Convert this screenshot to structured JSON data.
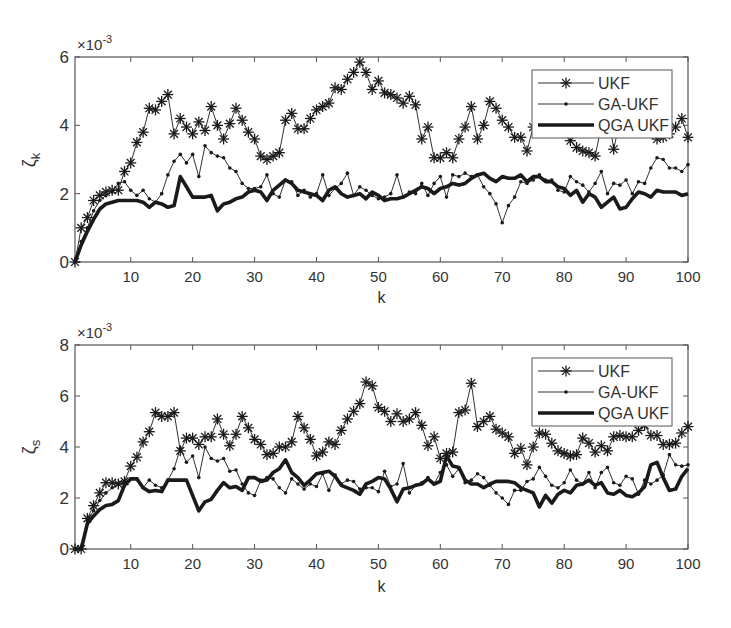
{
  "figure": {
    "top_cutoff_text": "",
    "colors": {
      "line": "#1a1a1a",
      "axis": "#555555",
      "background": "#ffffff"
    }
  },
  "chart_data": [
    {
      "type": "line",
      "title": "",
      "xlabel": "k",
      "ylabel": "ζ_k",
      "ylabel_main": "ζ",
      "ylabel_sub": "k",
      "exponent_label": "×10",
      "exponent_power": "-3",
      "xlim": [
        1,
        100
      ],
      "ylim": [
        0,
        6
      ],
      "xticks": [
        10,
        20,
        30,
        40,
        50,
        60,
        70,
        80,
        90,
        100
      ],
      "yticks": [
        0,
        2,
        4,
        6
      ],
      "grid": false,
      "legend_position": "upper right",
      "legend": [
        "UKF",
        "GA-UKF",
        "QGA UKF"
      ],
      "series": [
        {
          "name": "UKF",
          "marker": "asterisk",
          "linewidth": 1,
          "values": [
            0,
            1.0,
            1.3,
            1.8,
            1.95,
            2.05,
            2.1,
            2.1,
            2.65,
            2.9,
            3.5,
            3.8,
            4.5,
            4.45,
            4.7,
            4.9,
            3.75,
            4.2,
            3.95,
            3.75,
            4.1,
            3.85,
            4.55,
            4.0,
            3.6,
            4.05,
            4.5,
            4.15,
            3.8,
            3.6,
            3.1,
            3.0,
            3.1,
            3.2,
            4.15,
            4.35,
            3.9,
            3.9,
            4.2,
            4.45,
            4.55,
            4.65,
            5.1,
            5.05,
            5.35,
            5.55,
            5.85,
            5.55,
            5.05,
            5.3,
            4.95,
            4.9,
            4.8,
            4.65,
            4.85,
            4.6,
            3.6,
            3.95,
            3.05,
            3.05,
            3.2,
            3.05,
            3.6,
            3.95,
            4.55,
            3.6,
            4.0,
            4.7,
            4.5,
            4.15,
            3.95,
            3.65,
            3.65,
            3.25,
            3.95,
            4.4,
            4.55,
            4.5,
            4.05,
            3.8,
            3.55,
            3.35,
            3.25,
            3.2,
            3.1,
            3.95,
            4.5,
            3.3,
            4.15,
            4.2,
            4.15,
            3.95,
            4.4,
            4.55,
            3.6,
            3.65,
            3.75,
            3.95,
            4.2,
            3.65
          ]
        },
        {
          "name": "GA-UKF",
          "marker": "dot",
          "linewidth": 1,
          "values": [
            0,
            0.6,
            1.0,
            1.5,
            1.8,
            1.95,
            2.05,
            2.3,
            2.35,
            2.1,
            1.95,
            2.1,
            1.85,
            1.75,
            2.0,
            2.55,
            2.95,
            3.15,
            2.9,
            3.15,
            2.5,
            3.4,
            3.2,
            3.1,
            3.05,
            2.75,
            2.65,
            2.3,
            2.15,
            2.15,
            2.2,
            2.55,
            2.0,
            1.9,
            2.4,
            2.35,
            1.95,
            2.1,
            1.9,
            2.0,
            2.55,
            1.95,
            2.15,
            2.3,
            2.6,
            1.95,
            2.2,
            2.1,
            1.95,
            1.85,
            1.9,
            2.0,
            2.55,
            1.9,
            2.05,
            2.0,
            2.3,
            1.95,
            2.3,
            2.5,
            1.9,
            2.55,
            2.5,
            2.6,
            2.5,
            2.55,
            2.2,
            2.0,
            1.7,
            1.15,
            1.65,
            1.9,
            2.35,
            2.3,
            2.4,
            2.55,
            2.4,
            2.4,
            2.1,
            2.05,
            2.5,
            2.35,
            2.25,
            2.05,
            2.3,
            2.65,
            2.0,
            2.3,
            2.25,
            2.4,
            2.0,
            2.35,
            2.3,
            2.75,
            3.05,
            3.0,
            2.75,
            2.75,
            2.65,
            2.85
          ]
        },
        {
          "name": "QGA UKF",
          "marker": "none",
          "linewidth": 3,
          "values": [
            0,
            0.5,
            0.9,
            1.25,
            1.55,
            1.7,
            1.75,
            1.8,
            1.8,
            1.8,
            1.8,
            1.75,
            1.6,
            1.75,
            1.7,
            1.6,
            1.65,
            2.5,
            2.2,
            1.9,
            1.9,
            1.9,
            1.95,
            1.5,
            1.7,
            1.75,
            1.85,
            1.9,
            2.05,
            2.1,
            2.05,
            1.8,
            2.1,
            2.25,
            2.4,
            2.3,
            2.1,
            2.05,
            2.0,
            1.95,
            1.8,
            2.1,
            2.2,
            2.0,
            1.9,
            1.95,
            2.0,
            1.85,
            2.05,
            1.95,
            1.8,
            1.85,
            1.85,
            1.9,
            2.0,
            2.1,
            2.2,
            2.15,
            2.0,
            2.15,
            2.2,
            2.3,
            2.25,
            2.3,
            2.45,
            2.55,
            2.6,
            2.45,
            2.35,
            2.5,
            2.45,
            2.45,
            2.55,
            2.35,
            2.5,
            2.5,
            2.35,
            2.35,
            2.2,
            2.15,
            1.95,
            2.1,
            1.75,
            2.0,
            1.9,
            1.6,
            1.75,
            1.9,
            1.55,
            1.6,
            1.85,
            2.05,
            2.0,
            1.9,
            2.1,
            2.05,
            2.05,
            2.05,
            1.95,
            2.0
          ]
        }
      ]
    },
    {
      "type": "line",
      "title": "",
      "xlabel": "k",
      "ylabel": "ζ_s",
      "ylabel_main": "ζ",
      "ylabel_sub": "s",
      "exponent_label": "×10",
      "exponent_power": "-3",
      "xlim": [
        1,
        100
      ],
      "ylim": [
        0,
        8
      ],
      "xticks": [
        10,
        20,
        30,
        40,
        50,
        60,
        70,
        80,
        90,
        100
      ],
      "yticks": [
        0,
        2,
        4,
        6,
        8
      ],
      "grid": false,
      "legend_position": "upper right",
      "legend": [
        "UKF",
        "GA-UKF",
        "QGA UKF"
      ],
      "series": [
        {
          "name": "UKF",
          "marker": "asterisk",
          "linewidth": 1,
          "values": [
            0,
            0,
            1.2,
            1.7,
            2.2,
            2.6,
            2.6,
            2.55,
            2.65,
            3.25,
            3.6,
            4.2,
            4.6,
            5.35,
            5.2,
            5.2,
            5.35,
            3.85,
            4.35,
            4.35,
            4.1,
            4.4,
            4.4,
            5.1,
            4.5,
            4.05,
            4.5,
            5.2,
            4.75,
            4.3,
            4.1,
            3.7,
            3.75,
            4.0,
            4.0,
            4.2,
            5.2,
            4.75,
            4.3,
            3.65,
            3.8,
            4.2,
            4.1,
            4.65,
            5.1,
            5.4,
            5.7,
            6.55,
            6.4,
            5.55,
            5.4,
            5.0,
            5.3,
            5.0,
            5.1,
            5.35,
            4.85,
            4.05,
            4.4,
            3.55,
            3.75,
            3.8,
            5.35,
            5.45,
            6.5,
            4.8,
            5.0,
            5.2,
            4.7,
            4.55,
            4.4,
            3.75,
            3.95,
            3.3,
            4.0,
            4.55,
            4.5,
            4.15,
            3.85,
            3.75,
            3.65,
            3.7,
            4.35,
            4.15,
            3.8,
            4.05,
            3.85,
            4.4,
            4.45,
            4.4,
            4.4,
            4.65,
            4.85,
            4.45,
            4.45,
            4.1,
            4.1,
            4.15,
            4.55,
            4.8
          ]
        },
        {
          "name": "GA-UKF",
          "marker": "dot",
          "linewidth": 1,
          "values": [
            0,
            0,
            1.1,
            1.5,
            1.9,
            2.2,
            2.4,
            2.55,
            2.6,
            2.75,
            2.75,
            2.4,
            2.7,
            2.5,
            2.4,
            2.7,
            3.15,
            3.95,
            3.4,
            3.65,
            2.8,
            4.0,
            3.55,
            3.45,
            3.55,
            3.05,
            3.1,
            2.55,
            2.2,
            2.1,
            2.7,
            2.8,
            2.75,
            2.4,
            2.2,
            2.75,
            2.55,
            2.35,
            2.55,
            2.45,
            2.95,
            2.3,
            2.9,
            2.55,
            2.7,
            2.65,
            2.35,
            2.4,
            2.4,
            2.25,
            3.05,
            2.45,
            2.55,
            3.35,
            2.2,
            2.5,
            2.6,
            2.8,
            2.55,
            3.0,
            3.3,
            2.85,
            3.15,
            2.6,
            2.7,
            2.95,
            2.8,
            2.5,
            2.2,
            2.0,
            1.75,
            2.3,
            2.3,
            2.65,
            2.75,
            3.2,
            2.85,
            2.5,
            2.4,
            2.6,
            3.1,
            2.7,
            2.55,
            3.0,
            2.4,
            3.0,
            3.2,
            2.6,
            2.5,
            2.85,
            2.75,
            2.15,
            2.7,
            2.55,
            2.7,
            2.9,
            3.7,
            3.3,
            3.25,
            3.3
          ]
        },
        {
          "name": "QGA UKF",
          "marker": "none",
          "linewidth": 3,
          "values": [
            0,
            0,
            1.0,
            1.3,
            1.55,
            1.7,
            1.75,
            1.9,
            2.5,
            2.75,
            2.75,
            2.4,
            2.25,
            2.3,
            2.25,
            2.7,
            2.7,
            2.7,
            2.7,
            2.1,
            1.5,
            1.85,
            1.95,
            2.3,
            2.6,
            2.4,
            2.45,
            2.3,
            2.8,
            2.8,
            2.65,
            2.7,
            3.0,
            3.15,
            3.5,
            3.0,
            2.8,
            2.5,
            2.7,
            2.95,
            3.0,
            3.05,
            2.85,
            2.5,
            2.4,
            2.3,
            2.15,
            2.55,
            2.65,
            2.8,
            2.75,
            2.35,
            1.85,
            2.35,
            2.4,
            2.5,
            2.55,
            2.75,
            2.55,
            2.65,
            3.65,
            3.25,
            3.2,
            2.7,
            2.55,
            2.55,
            2.4,
            2.55,
            2.65,
            2.65,
            2.65,
            2.6,
            2.4,
            2.3,
            2.2,
            1.65,
            2.1,
            1.8,
            2.15,
            2.3,
            2.2,
            2.5,
            2.55,
            2.7,
            2.5,
            2.6,
            2.2,
            2.15,
            2.3,
            2.1,
            2.05,
            2.2,
            2.45,
            3.3,
            3.4,
            2.8,
            2.3,
            2.35,
            2.85,
            3.15
          ]
        }
      ]
    }
  ],
  "plots": [
    {
      "id": "top",
      "box": {
        "left": 75,
        "top": 57,
        "right": 688,
        "bottom": 262
      },
      "legend_box": {
        "left": 532,
        "top": 70,
        "right": 672,
        "bottom": 138
      },
      "xlabel_y": 303,
      "exp_y": 50,
      "ylabel_y": 160
    },
    {
      "id": "bottom",
      "box": {
        "left": 75,
        "top": 345,
        "right": 688,
        "bottom": 549
      },
      "legend_box": {
        "left": 532,
        "top": 358,
        "right": 672,
        "bottom": 426
      },
      "xlabel_y": 592,
      "exp_y": 338,
      "ylabel_y": 447
    }
  ]
}
